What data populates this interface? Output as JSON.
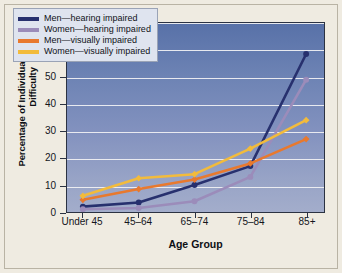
{
  "chart_data": {
    "type": "line",
    "title": "",
    "xlabel": "Age Group",
    "ylabel": "Percentage of Individuals Reporting Difficulty",
    "categories": [
      "Under 45",
      "45–64",
      "65–74",
      "75–84",
      "85+"
    ],
    "ylim": [
      0,
      70
    ],
    "yticks": [
      0,
      10,
      20,
      30,
      40,
      50,
      60,
      70
    ],
    "grid": true,
    "legend_position": "top-left",
    "series": [
      {
        "name": "Men—hearing impaired",
        "color": "#27306e",
        "marker": "circle",
        "values": [
          2,
          3.5,
          10,
          17,
          58.5
        ]
      },
      {
        "name": "Women—hearing impaired",
        "color": "#9b8cba",
        "marker": "circle",
        "values": [
          1,
          1.5,
          4,
          13,
          49
        ]
      },
      {
        "name": "Men—visually impaired",
        "color": "#e8792e",
        "marker": "diamond",
        "values": [
          4.5,
          8.5,
          12,
          18,
          27
        ]
      },
      {
        "name": "Women—visually impaired",
        "color": "#f2bb3c",
        "marker": "diamond",
        "values": [
          6,
          12.5,
          14,
          23.5,
          34
        ]
      }
    ]
  },
  "colors": {
    "page_background": "#efebe1",
    "plot_top": "#5871a8",
    "plot_bottom": "#a3adcb",
    "gridline": "#f2f2f4",
    "axis": "#2b3242",
    "legend_background": "#dfe4ef",
    "legend_border": "#9aa3b6"
  }
}
